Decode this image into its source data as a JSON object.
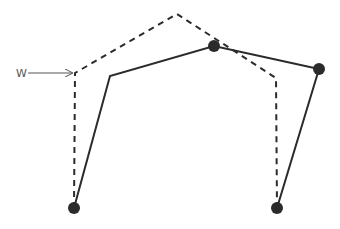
{
  "diagram": {
    "label_text": "W",
    "label_position": [
      16,
      68
    ],
    "arrow": {
      "from": [
        28,
        73
      ],
      "to": [
        72,
        73
      ]
    },
    "colors": {
      "line": "#2b2b2b",
      "dashed": "#2b2b2b",
      "node": "#2b2b2b",
      "label": "#555555",
      "background": "#ffffff"
    },
    "dashed_polyline": [
      [
        74,
        208
      ],
      [
        75,
        73
      ],
      [
        177,
        14
      ],
      [
        276,
        78
      ],
      [
        277,
        208
      ]
    ],
    "solid_polyline": [
      [
        74,
        208
      ],
      [
        110,
        76
      ],
      [
        214,
        46
      ],
      [
        319,
        69
      ],
      [
        277,
        208
      ]
    ],
    "nodes": [
      {
        "id": "bottom-left",
        "x": 74,
        "y": 208
      },
      {
        "id": "top-middle",
        "x": 214,
        "y": 46
      },
      {
        "id": "right",
        "x": 319,
        "y": 69
      },
      {
        "id": "bottom-right",
        "x": 277,
        "y": 208
      }
    ],
    "node_radius": 6
  }
}
